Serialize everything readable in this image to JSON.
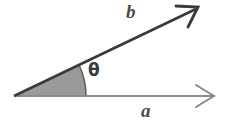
{
  "figure": {
    "kind": "vector-angle-diagram",
    "background_color": "#ffffff",
    "width": 226,
    "height": 123,
    "vertex": {
      "x": 14,
      "y": 96
    },
    "labels": {
      "vector_b": "b",
      "vector_a": "a",
      "angle": "θ"
    },
    "vectors": [
      {
        "name": "b",
        "label": "b",
        "from": {
          "x": 14,
          "y": 96
        },
        "to": {
          "x": 198,
          "y": 8
        },
        "angle_degrees": 25.5,
        "color": "#3a3a3a",
        "stroke_width": 2.4,
        "arrowhead": "open-v"
      },
      {
        "name": "a",
        "label": "a",
        "from": {
          "x": 14,
          "y": 96
        },
        "to": {
          "x": 214,
          "y": 96
        },
        "angle_degrees": 0,
        "color": "#8a8a8a",
        "stroke_width": 1.6,
        "arrowhead": "open-v"
      }
    ],
    "angle_sector": {
      "label": "θ",
      "start_degrees": 0,
      "end_degrees": 25.5,
      "radius": 72,
      "fill_color": "#9a9a9a",
      "stroke_color": "#5a5a5a"
    }
  }
}
